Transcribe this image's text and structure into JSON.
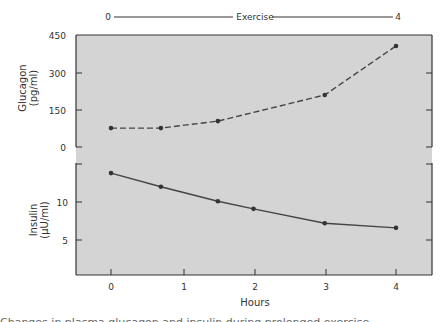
{
  "exercise_bar": {
    "start_label": "0",
    "label": "Exercise",
    "end_label": "4"
  },
  "panels": {
    "glucagon": {
      "ylabel_line1": "Glucagon",
      "ylabel_line2": "(pg/ml)",
      "ticks": [
        "450",
        "300",
        "150",
        "0"
      ]
    },
    "insulin": {
      "ylabel_line1": "Insulin",
      "ylabel_line2": "(μU/ml)",
      "ticks": [
        "10",
        "5"
      ]
    }
  },
  "xaxis": {
    "label": "Hours",
    "ticks": [
      "0",
      "1",
      "2",
      "3",
      "4"
    ]
  },
  "colors": {
    "plot_bg": "#d4d4d4",
    "line": "#444444",
    "frame": "#333333"
  },
  "chart_data": [
    {
      "type": "line",
      "title": "",
      "xlabel": "Hours",
      "ylabel": "Glucagon (pg/ml)",
      "ylim": [
        0,
        450
      ],
      "yticks": [
        0,
        150,
        300,
        450
      ],
      "line_style": "dashed",
      "series": [
        {
          "name": "Glucagon",
          "x": [
            0,
            0.7,
            1.5,
            3.0,
            4.0
          ],
          "values": [
            76,
            76,
            104,
            209,
            406
          ]
        }
      ],
      "annotation": "Exercise from 0 to 4 hours"
    },
    {
      "type": "line",
      "title": "",
      "xlabel": "Hours",
      "ylabel": "Insulin (μU/ml)",
      "ylim": [
        0,
        15
      ],
      "yticks": [
        5,
        10
      ],
      "line_style": "solid",
      "series": [
        {
          "name": "Insulin",
          "x": [
            0,
            0.7,
            1.5,
            2.0,
            3.0,
            4.0
          ],
          "values": [
            13.8,
            12.0,
            10.1,
            9.1,
            7.2,
            6.6
          ]
        }
      ]
    }
  ],
  "caption_fragment": "Changes in plasma glucagon and insulin during prolonged exercise"
}
